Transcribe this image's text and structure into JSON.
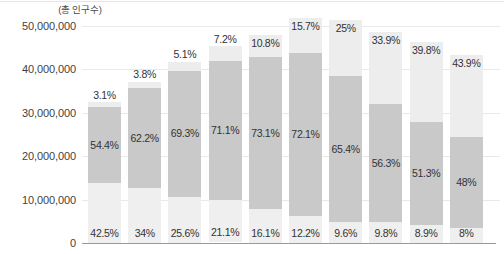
{
  "axis_note": "(총 인구수)",
  "y_ticks": [
    "60,000,000",
    "50,000,000",
    "40,000,000",
    "30,000,000",
    "20,000,000",
    "10,000,000",
    "0"
  ],
  "colors": {
    "segment_top": "#ededed",
    "segment_middle": "#c9c9c9",
    "segment_bottom": "#efefef",
    "gridline": "#e9e9e9",
    "baseline": "#9a9a9a",
    "label_text": "#333333"
  },
  "chart_data": {
    "type": "bar",
    "title": "",
    "subtitle": "",
    "xlabel": "",
    "ylabel": "(총 인구수)",
    "ylim": [
      0,
      60000000
    ],
    "ytick_values": [
      60000000,
      50000000,
      40000000,
      30000000,
      20000000,
      10000000,
      0
    ],
    "ytick_labels": [
      "60,000,000",
      "50,000,000",
      "40,000,000",
      "30,000,000",
      "20,000,000",
      "10,000,000",
      "0"
    ],
    "grid": true,
    "legend": false,
    "stacked": true,
    "bar_count": 10,
    "categories": [
      "1",
      "2",
      "3",
      "4",
      "5",
      "6",
      "7",
      "8",
      "9",
      "10"
    ],
    "totals": [
      32400000,
      37100000,
      41800000,
      45300000,
      48000000,
      51800000,
      51300000,
      48600000,
      46400000,
      43400000
    ],
    "series": [
      {
        "name": "bottom",
        "values": [
          42.5,
          34.0,
          25.6,
          21.1,
          16.1,
          12.2,
          9.6,
          9.8,
          8.9,
          8.0
        ],
        "labels": [
          "42.5%",
          "34%",
          "25.6%",
          "21.1%",
          "16.1%",
          "12.2%",
          "9.6%",
          "9.8%",
          "8.9%",
          "8%"
        ]
      },
      {
        "name": "middle",
        "values": [
          54.4,
          62.2,
          69.3,
          71.1,
          73.1,
          72.1,
          65.4,
          56.3,
          51.3,
          48.0
        ],
        "labels": [
          "54.4%",
          "62.2%",
          "69.3%",
          "71.1%",
          "73.1%",
          "72.1%",
          "65.4%",
          "56.3%",
          "51.3%",
          "48%"
        ]
      },
      {
        "name": "top",
        "values": [
          3.1,
          3.8,
          5.1,
          7.2,
          10.8,
          15.7,
          25.0,
          33.9,
          39.8,
          43.9
        ],
        "labels": [
          "3.1%",
          "3.8%",
          "5.1%",
          "7.2%",
          "10.8%",
          "15.7%",
          "25%",
          "33.9%",
          "39.8%",
          "43.9%"
        ]
      }
    ]
  },
  "geometry": {
    "baseline_y": 243,
    "y_top_value_px": 26,
    "px_per_10m": 43.4,
    "bar_width": 33,
    "bar_pitch": 40.2,
    "first_bar_left": 6,
    "top_label_outside_index_limit": 6
  }
}
